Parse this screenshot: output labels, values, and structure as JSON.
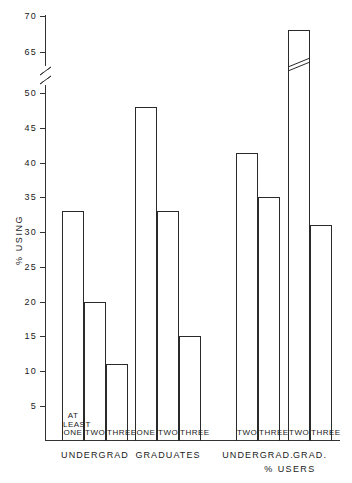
{
  "chart_data": {
    "type": "bar",
    "title": "",
    "subtitle": "",
    "xlabel": "% USERS",
    "ylabel": "% USING",
    "ylim": [
      0,
      70
    ],
    "yticks": [
      5,
      10,
      15,
      20,
      25,
      30,
      35,
      40,
      45,
      50,
      65,
      70
    ],
    "ytick_labels": [
      "5",
      "10",
      "15",
      "20",
      "25",
      "30",
      "35",
      "40",
      "45",
      "50",
      "65",
      "70"
    ],
    "axis_break": {
      "present": true,
      "between": [
        50,
        65
      ],
      "style": "slanted-double-line"
    },
    "grid": false,
    "legend": null,
    "bar_style": {
      "fill": "none",
      "edge_color": "#2a2a2a",
      "line_width": 1
    },
    "groups": [
      {
        "label": "UNDERGRAD",
        "bars": [
          {
            "label": "AT LEAST ONE",
            "label_lines": "AT\nLEAST\nONE",
            "value": 33
          },
          {
            "label": "TWO",
            "label_lines": "TWO",
            "value": 20
          },
          {
            "label": "THREE",
            "label_lines": "THREE",
            "value": 11
          }
        ]
      },
      {
        "label": "GRADUATES",
        "bars": [
          {
            "label": "ONE",
            "label_lines": "ONE",
            "value": 48
          },
          {
            "label": "TWO",
            "label_lines": "TWO",
            "value": 33
          },
          {
            "label": "THREE",
            "label_lines": "THREE",
            "value": 15
          }
        ]
      },
      {
        "label": "UNDERGRAD.",
        "bars": [
          {
            "label": "TWO",
            "label_lines": "TWO",
            "value": 51
          },
          {
            "label": "THREE",
            "label_lines": "THREE",
            "value": 35
          }
        ]
      },
      {
        "label": "GRAD.",
        "bars": [
          {
            "label": "TWO",
            "label_lines": "TWO",
            "value": 68,
            "crosses_break": true
          },
          {
            "label": "THREE",
            "label_lines": "THREE",
            "value": 31
          }
        ]
      }
    ],
    "categories": [
      "UNDERGRAD / AT LEAST ONE",
      "UNDERGRAD / TWO",
      "UNDERGRAD / THREE",
      "GRADUATES / ONE",
      "GRADUATES / TWO",
      "GRADUATES / THREE",
      "UNDERGRAD. % USERS / TWO",
      "UNDERGRAD. % USERS / THREE",
      "GRAD. % USERS / TWO",
      "GRAD. % USERS / THREE"
    ],
    "values": [
      33,
      20,
      11,
      48,
      33,
      15,
      51,
      35,
      68,
      31
    ]
  }
}
